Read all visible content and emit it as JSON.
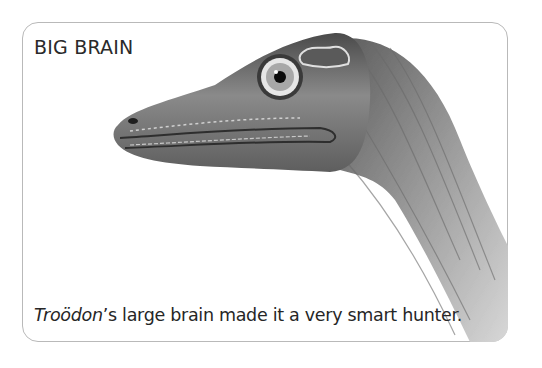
{
  "card": {
    "title": "BIG BRAIN",
    "caption": {
      "species": "Troödon",
      "rest": "’s large brain made it a very smart hunter."
    },
    "illustration": {
      "subject": "Troodon dinosaur head and neck, brain highlighted",
      "style": "grayscale pencil illustration"
    },
    "colors": {
      "border": "#b9b9b9",
      "text": "#262626",
      "brain_patch": "#5a5a5a"
    }
  }
}
